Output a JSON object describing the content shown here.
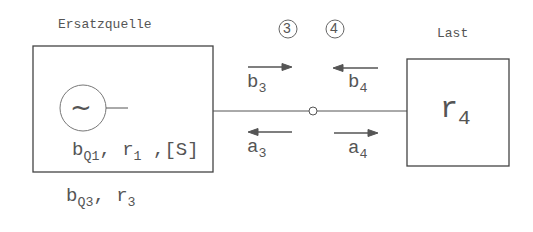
{
  "diagram": {
    "source_box": {
      "title": "Ersatzquelle",
      "symbol": "~",
      "params": {
        "b": "b",
        "b_sub": "Q1",
        "sep1": ",",
        "r": " r",
        "r_sub": "1",
        "sep2": " ,",
        "s": "[S]"
      }
    },
    "below_source": {
      "b": "b",
      "b_sub": "Q3",
      "sep": ",",
      "r": " r",
      "r_sub": "3"
    },
    "ports": {
      "left": "3",
      "right": "4"
    },
    "waves": {
      "b3": {
        "base": "b",
        "sub": "3",
        "direction": "right"
      },
      "b4": {
        "base": "b",
        "sub": "4",
        "direction": "left"
      },
      "a3": {
        "base": "a",
        "sub": "3",
        "direction": "left"
      },
      "a4": {
        "base": "a",
        "sub": "4",
        "direction": "right"
      }
    },
    "load_box": {
      "title": "Last",
      "value_base": "r",
      "value_sub": "4"
    }
  }
}
